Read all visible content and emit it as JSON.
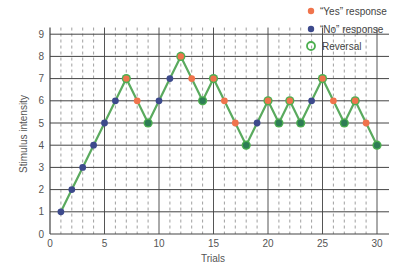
{
  "chart_data": {
    "type": "line",
    "title": "",
    "xlabel": "Trials",
    "ylabel": "Stimulus intensity",
    "xlim": [
      0,
      30
    ],
    "ylim": [
      0,
      9
    ],
    "xticks": [
      0,
      5,
      10,
      15,
      20,
      25,
      30
    ],
    "yticks": [
      0,
      1,
      2,
      3,
      4,
      5,
      6,
      7,
      8,
      9
    ],
    "grid": true,
    "legend_position": "top-right",
    "legend": [
      {
        "label": "“Yes” response",
        "marker": "filled-circle",
        "color": "#f0744c"
      },
      {
        "label": "“No” response",
        "marker": "filled-circle",
        "color": "#3d4a8c"
      },
      {
        "label": "Reversal",
        "marker": "open-circle",
        "color": "#4caf50"
      }
    ],
    "x": [
      1,
      2,
      3,
      4,
      5,
      6,
      7,
      8,
      9,
      10,
      11,
      12,
      13,
      14,
      15,
      16,
      17,
      18,
      19,
      20,
      21,
      22,
      23,
      24,
      25,
      26,
      27,
      28,
      29,
      30
    ],
    "series": [
      {
        "name": "Stimulus intensity",
        "values": [
          1,
          2,
          3,
          4,
          5,
          6,
          7,
          6,
          5,
          6,
          7,
          8,
          7,
          6,
          7,
          6,
          5,
          4,
          5,
          6,
          5,
          6,
          5,
          6,
          7,
          6,
          5,
          6,
          5,
          4
        ],
        "responses": [
          "no",
          "no",
          "no",
          "no",
          "no",
          "no",
          "yes",
          "yes",
          "no",
          "no",
          "no",
          "yes",
          "yes",
          "no",
          "yes",
          "yes",
          "yes",
          "no",
          "no",
          "yes",
          "no",
          "yes",
          "no",
          "no",
          "yes",
          "yes",
          "no",
          "yes",
          "yes",
          "no"
        ],
        "reversals": [
          7,
          9,
          12,
          14,
          15,
          18,
          20,
          21,
          22,
          23,
          25,
          27,
          28,
          30
        ]
      }
    ]
  },
  "colors": {
    "yes": "#f0744c",
    "no": "#3d4a8c",
    "reversal": "#4caf50",
    "line": "#5aaa5e",
    "reversal_fill_low": "#2e7d55"
  }
}
